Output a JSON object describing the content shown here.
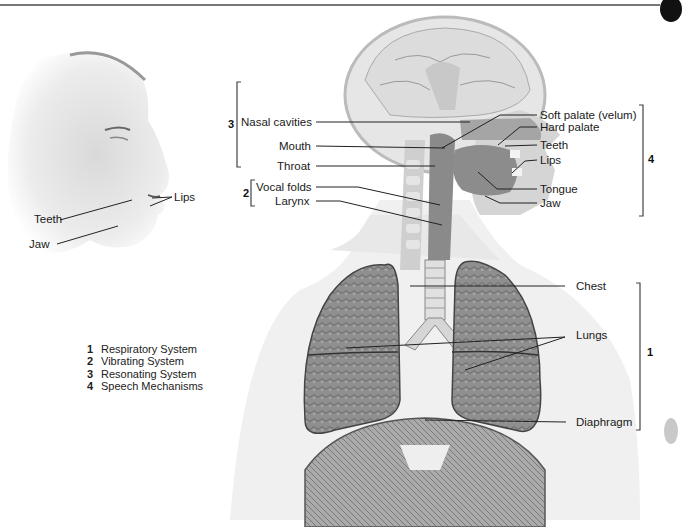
{
  "figure": {
    "type": "anatomical diagram"
  },
  "face_labels": {
    "lips": "Lips",
    "teeth": "Teeth",
    "jaw": "Jaw"
  },
  "left_labels": {
    "group3": {
      "number": "3",
      "items": [
        "Nasal cavities",
        "Mouth",
        "Throat"
      ]
    },
    "group2": {
      "number": "2",
      "items": [
        "Vocal folds",
        "Larynx"
      ]
    }
  },
  "right_labels": {
    "group4": {
      "number": "4",
      "items": [
        "Soft palate (velum)",
        "Hard palate",
        "Teeth",
        "Lips",
        "Tongue",
        "Jaw"
      ]
    },
    "group1": {
      "number": "1",
      "items": [
        "Chest",
        "Lungs",
        "Diaphragm"
      ]
    }
  },
  "legend": [
    {
      "number": "1",
      "label": "Respiratory System"
    },
    {
      "number": "2",
      "label": "Vibrating System"
    },
    {
      "number": "3",
      "label": "Resonating System"
    },
    {
      "number": "4",
      "label": "Speech Mechanisms"
    }
  ],
  "colors": {
    "line": "#222222",
    "bracket": "#444444",
    "body_fill": "#f0f0f0",
    "lung_fill": "#8d8d8d",
    "tissue_fill": "#9a9a9a"
  }
}
